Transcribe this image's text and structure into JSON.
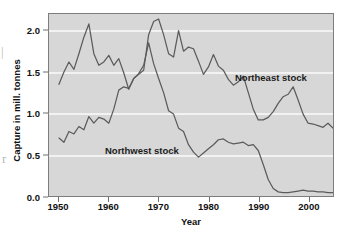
{
  "edge_artifacts": {
    "top_fragment": "|",
    "bottom_fragment": "r"
  },
  "chart_data": {
    "type": "line",
    "title": "",
    "subtitle": "",
    "xlabel": "Year",
    "ylabel": "Capture in mill. tonnes",
    "xlim": [
      1948,
      2005
    ],
    "ylim": [
      0.0,
      2.2
    ],
    "x_ticks": [
      1950,
      1960,
      1970,
      1980,
      1990,
      2000
    ],
    "x_tick_labels": [
      "1950",
      "1960",
      "1970",
      "1980",
      "1990",
      "2000"
    ],
    "y_ticks": [
      0.0,
      0.5,
      1.0,
      1.5,
      2.0
    ],
    "y_tick_labels": [
      "0.0",
      "0.5",
      "1.0",
      "1.5",
      "2.0"
    ],
    "grid": true,
    "grid_color": "#f2f2f2",
    "plot_background": "#d7d7d7",
    "line_color": "#5b5b5b",
    "legend_position": "inline-annotations",
    "annotations": [
      {
        "text": "Northeast stock",
        "x": 1988,
        "y": 1.45
      },
      {
        "text": "Northwest stock",
        "x": 1963,
        "y": 0.63
      }
    ],
    "series": [
      {
        "name": "Northeast stock",
        "label": "Northeast stock",
        "x": [
          1950,
          1951,
          1952,
          1953,
          1954,
          1955,
          1956,
          1957,
          1958,
          1959,
          1960,
          1961,
          1962,
          1963,
          1964,
          1965,
          1966,
          1967,
          1968,
          1969,
          1970,
          1971,
          1972,
          1973,
          1974,
          1975,
          1976,
          1977,
          1978,
          1979,
          1980,
          1981,
          1982,
          1983,
          1984,
          1985,
          1986,
          1987,
          1988,
          1989,
          1990,
          1991,
          1992,
          1993,
          1994,
          1995,
          1996,
          1997,
          1998,
          1999,
          2000,
          2001,
          2002,
          2003,
          2004
        ],
        "values": [
          1.35,
          1.5,
          1.62,
          1.53,
          1.72,
          1.92,
          2.08,
          1.72,
          1.58,
          1.62,
          1.7,
          1.58,
          1.66,
          1.49,
          1.29,
          1.42,
          1.47,
          1.52,
          1.95,
          2.11,
          2.14,
          1.95,
          1.72,
          1.68,
          2.0,
          1.75,
          1.8,
          1.78,
          1.63,
          1.47,
          1.56,
          1.71,
          1.57,
          1.52,
          1.41,
          1.34,
          1.38,
          1.45,
          1.25,
          1.05,
          0.92,
          0.92,
          0.95,
          1.02,
          1.12,
          1.2,
          1.23,
          1.32,
          1.16,
          0.99,
          0.88,
          0.87,
          0.85,
          0.83,
          0.88
        ],
        "last_value": 0.82
      },
      {
        "name": "Northwest stock",
        "label": "Northwest stock",
        "x": [
          1950,
          1951,
          1952,
          1953,
          1954,
          1955,
          1956,
          1957,
          1958,
          1959,
          1960,
          1961,
          1962,
          1963,
          1964,
          1965,
          1966,
          1967,
          1968,
          1969,
          1970,
          1971,
          1972,
          1973,
          1974,
          1975,
          1976,
          1977,
          1978,
          1979,
          1980,
          1981,
          1982,
          1983,
          1984,
          1985,
          1986,
          1987,
          1988,
          1989,
          1990,
          1991,
          1992,
          1993,
          1994,
          1995,
          1996,
          1997,
          1998,
          1999,
          2000,
          2001,
          2002,
          2003,
          2004
        ],
        "values": [
          0.7,
          0.65,
          0.78,
          0.75,
          0.84,
          0.8,
          0.96,
          0.88,
          0.95,
          0.93,
          0.88,
          1.05,
          1.28,
          1.32,
          1.3,
          1.42,
          1.48,
          1.58,
          1.85,
          1.6,
          1.42,
          1.25,
          1.03,
          0.99,
          0.82,
          0.78,
          0.62,
          0.53,
          0.47,
          0.52,
          0.57,
          0.62,
          0.68,
          0.69,
          0.65,
          0.63,
          0.64,
          0.65,
          0.61,
          0.62,
          0.55,
          0.38,
          0.2,
          0.09,
          0.05,
          0.04,
          0.04,
          0.05,
          0.06,
          0.07,
          0.06,
          0.06,
          0.05,
          0.05,
          0.04
        ],
        "last_value": 0.04
      }
    ]
  }
}
